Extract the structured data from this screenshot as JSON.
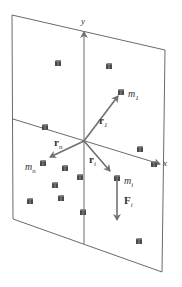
{
  "figure": {
    "colors": {
      "plane_edge": "#6a6a6a",
      "axis": "#6a6a6a",
      "vector": "#707070",
      "cube_fill": "#4a4a4a",
      "cube_light": "#8a8a8a",
      "text": "#333333"
    },
    "plane": {
      "corners": [
        [
          12,
          15
        ],
        [
          165,
          50
        ],
        [
          162,
          272
        ],
        [
          13,
          219
        ]
      ]
    },
    "axes": {
      "y": {
        "label": "y",
        "from": [
          84,
          244
        ],
        "to": [
          84,
          32
        ],
        "label_pos": [
          81,
          24
        ]
      },
      "x": {
        "label": "x",
        "from": [
          13,
          119
        ],
        "to": [
          160,
          164
        ],
        "label_pos": [
          163,
          166
        ]
      },
      "origin": [
        84,
        141
      ]
    },
    "vectors": [
      {
        "name": "r1",
        "label_main": "r",
        "label_sub": "1",
        "from": [
          84,
          141
        ],
        "to": [
          118,
          96
        ],
        "label_pos": [
          99,
          124
        ]
      },
      {
        "name": "rn",
        "label_main": "r",
        "label_sub": "n",
        "from": [
          84,
          141
        ],
        "to": [
          50,
          157
        ],
        "label_pos": [
          54,
          146
        ]
      },
      {
        "name": "ri",
        "label_main": "r",
        "label_sub": "i",
        "from": [
          84,
          141
        ],
        "to": [
          110,
          171
        ],
        "label_pos": [
          89,
          163
        ]
      },
      {
        "name": "Fi",
        "label_main": "F",
        "label_sub": "i",
        "from": [
          117,
          181
        ],
        "to": [
          117,
          220
        ],
        "label_pos": [
          124,
          204
        ]
      }
    ],
    "masses": [
      {
        "label_main": "m",
        "label_sub": "1",
        "pos": [
          128,
          94
        ]
      },
      {
        "label_main": "m",
        "label_sub": "n",
        "pos": [
          25,
          167
        ]
      },
      {
        "label_main": "m",
        "label_sub": "i",
        "pos": [
          124,
          181
        ]
      }
    ],
    "particles": [
      [
        58,
        63
      ],
      [
        109,
        66
      ],
      [
        121,
        92
      ],
      [
        45,
        127
      ],
      [
        140,
        149
      ],
      [
        154,
        164
      ],
      [
        43,
        163
      ],
      [
        65,
        168
      ],
      [
        80,
        177
      ],
      [
        117,
        178
      ],
      [
        55,
        185
      ],
      [
        30,
        201
      ],
      [
        61,
        198
      ],
      [
        83,
        212
      ],
      [
        139,
        241
      ]
    ]
  }
}
